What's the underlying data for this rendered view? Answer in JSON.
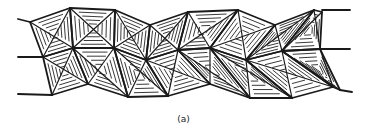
{
  "figure": {
    "caption": "(a)",
    "row_count": 2,
    "squares_per_row": 8,
    "hatch_lines_per_triangle": 4,
    "line_color": "#1a1a1a",
    "background": "#ffffff"
  }
}
